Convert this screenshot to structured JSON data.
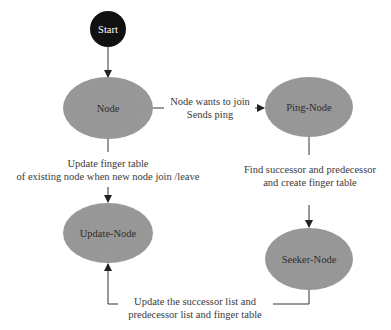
{
  "diagram": {
    "type": "state-flow",
    "colors": {
      "start_fill": "#111111",
      "node_fill": "#9a9a9a",
      "line": "#333333",
      "text": "#333333"
    },
    "nodes": {
      "start": {
        "label": "Start"
      },
      "node": {
        "label": "Node"
      },
      "ping_node": {
        "label": "Ping-Node"
      },
      "update_node": {
        "label": "Update-Node"
      },
      "seeker_node": {
        "label": "Seeker-Node"
      }
    },
    "edges": {
      "node_to_ping": {
        "line1": "Node wants to join",
        "line2": "Sends ping"
      },
      "node_to_update": {
        "line1": "Update finger table",
        "line2": "of existing node when new node join /leave"
      },
      "ping_to_seeker": {
        "line1": "Find successor and predecessor",
        "line2": "and create finger table"
      },
      "seeker_to_update": {
        "line1": "Update the successor list and",
        "line2": "predecessor list and finger table"
      }
    }
  }
}
